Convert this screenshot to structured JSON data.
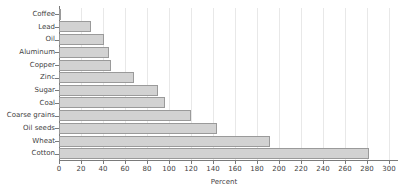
{
  "chart_data": {
    "type": "bar",
    "orientation": "horizontal",
    "title": "",
    "subtitle": "",
    "xlabel": "Percent",
    "ylabel": "",
    "categories": [
      "Coffee",
      "Lead",
      "Oil",
      "Aluminum",
      "Copper",
      "Zinc",
      "Sugar",
      "Coal",
      "Coarse grains",
      "Oil seeds",
      "Wheat",
      "Cotton"
    ],
    "values": [
      2,
      29,
      41,
      45,
      47,
      68,
      90,
      96,
      120,
      144,
      192,
      282
    ],
    "xlim": [
      0,
      300
    ],
    "xticks": [
      0,
      20,
      40,
      60,
      80,
      100,
      120,
      140,
      160,
      180,
      200,
      220,
      240,
      260,
      280,
      300
    ],
    "xtick_labels": [
      "0",
      "20",
      "40",
      "60",
      "80",
      "100",
      "120",
      "140",
      "160",
      "180",
      "200",
      "220",
      "240",
      "260",
      "280",
      "300"
    ],
    "grid": "vertical",
    "legend": null,
    "bar_fill_color": "#d2d2d2",
    "bar_border_color": "#9a9a9a",
    "gridline_color": "#e8e8e8",
    "axis_color": "#7a7a7a",
    "background_color": "#ffffff"
  }
}
